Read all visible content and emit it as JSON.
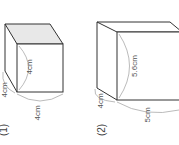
{
  "figures": [
    {
      "number": "(1)",
      "shape": "cube",
      "dimensions": {
        "depth": "4cm",
        "height": "4cm",
        "width": "4cm"
      }
    },
    {
      "number": "(2)",
      "shape": "rectangular-prism",
      "dimensions": {
        "depth": "4cm",
        "height": "5.6cm",
        "width": "5cm"
      }
    }
  ],
  "colors": {
    "edge": "#333333",
    "top_face": "#e8e8e8",
    "dimension_arc": "#aaaaaa",
    "text": "#555555"
  }
}
